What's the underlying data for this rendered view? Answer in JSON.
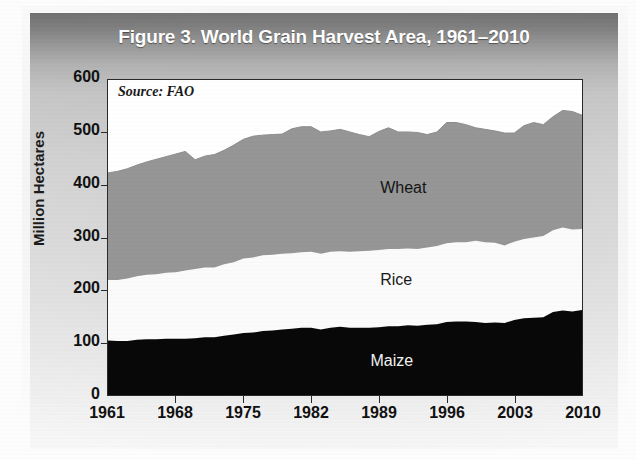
{
  "figure": {
    "title": "Figure 3. World Grain Harvest Area, 1961–2010",
    "source_note": "Source: FAO"
  },
  "chart_data": {
    "type": "area",
    "title": "Figure 3. World Grain Harvest Area, 1961–2010",
    "subtitle": "",
    "annotations": [
      "Source: FAO"
    ],
    "xlabel": "",
    "ylabel": "Million Hectares",
    "xlim": [
      1961,
      2010
    ],
    "ylim": [
      0,
      600
    ],
    "ytick_labels": [
      "0",
      "100",
      "200",
      "300",
      "400",
      "500",
      "600"
    ],
    "ytick_values": [
      0,
      100,
      200,
      300,
      400,
      500,
      600
    ],
    "xtick_labels": [
      "1961",
      "1968",
      "1975",
      "1982",
      "1989",
      "1996",
      "2003",
      "2010"
    ],
    "xtick_values": [
      1961,
      1968,
      1975,
      1982,
      1989,
      1996,
      2003,
      2010
    ],
    "grid": false,
    "legend": "inline-labels",
    "stacked": true,
    "stack_order": [
      "Maize",
      "Rice",
      "Wheat"
    ],
    "colors": {
      "Maize": "#080808",
      "Rice": "#fbfbfb",
      "Wheat": "#969696",
      "header": "#6f6f6f"
    },
    "x": [
      1961,
      1962,
      1963,
      1964,
      1965,
      1966,
      1967,
      1968,
      1969,
      1970,
      1971,
      1972,
      1973,
      1974,
      1975,
      1976,
      1977,
      1978,
      1979,
      1980,
      1981,
      1982,
      1983,
      1984,
      1985,
      1986,
      1987,
      1988,
      1989,
      1990,
      1991,
      1992,
      1993,
      1994,
      1995,
      1996,
      1997,
      1998,
      1999,
      2000,
      2001,
      2002,
      2003,
      2004,
      2005,
      2006,
      2007,
      2008,
      2009,
      2010
    ],
    "series": [
      {
        "name": "Maize",
        "values": [
          104,
          103,
          103,
          105,
          106,
          106,
          107,
          107,
          107,
          108,
          110,
          110,
          113,
          115,
          118,
          119,
          122,
          123,
          125,
          126,
          128,
          128,
          125,
          128,
          130,
          128,
          128,
          128,
          129,
          131,
          131,
          133,
          132,
          134,
          135,
          139,
          140,
          140,
          139,
          137,
          138,
          137,
          143,
          146,
          147,
          148,
          158,
          161,
          159,
          162
        ]
      },
      {
        "name": "Rice",
        "values": [
          115,
          116,
          119,
          121,
          123,
          124,
          126,
          127,
          130,
          132,
          133,
          133,
          136,
          138,
          142,
          143,
          144,
          144,
          144,
          144,
          144,
          145,
          144,
          145,
          144,
          145,
          146,
          147,
          147,
          147,
          147,
          146,
          146,
          147,
          149,
          150,
          151,
          151,
          155,
          154,
          152,
          148,
          149,
          151,
          153,
          155,
          156,
          158,
          156,
          154
        ]
      },
      {
        "name": "Wheat",
        "values": [
          204,
          207,
          209,
          212,
          215,
          219,
          221,
          225,
          227,
          208,
          212,
          215,
          217,
          223,
          227,
          231,
          229,
          229,
          228,
          237,
          239,
          238,
          232,
          230,
          232,
          228,
          222,
          217,
          226,
          231,
          223,
          222,
          222,
          215,
          217,
          230,
          228,
          224,
          215,
          215,
          213,
          214,
          207,
          216,
          219,
          212,
          216,
          223,
          225,
          217
        ]
      }
    ],
    "totals": [
      423,
      426,
      431,
      438,
      444,
      449,
      454,
      459,
      464,
      448,
      455,
      458,
      466,
      476,
      487,
      493,
      495,
      496,
      497,
      507,
      511,
      511,
      501,
      503,
      506,
      501,
      496,
      492,
      502,
      509,
      501,
      501,
      500,
      496,
      501,
      519,
      519,
      515,
      509,
      506,
      503,
      499,
      499,
      513,
      519,
      515,
      530,
      542,
      540,
      533
    ],
    "series_labels": [
      {
        "text": "Wheat",
        "x": 1992,
        "y": 390
      },
      {
        "text": "Rice",
        "x": 1992,
        "y": 215
      },
      {
        "text": "Maize",
        "x": 1991,
        "y": 62
      }
    ]
  }
}
